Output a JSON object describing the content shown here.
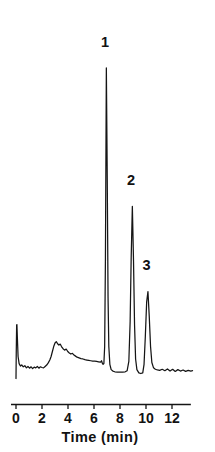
{
  "chart_data": {
    "type": "line",
    "title": "",
    "subtitle": "",
    "xlabel": "Time (min)",
    "ylabel": "",
    "xlim": [
      -0.25,
      13.6
    ],
    "ylim": [
      0,
      1.0
    ],
    "grid": false,
    "legend": "none",
    "x_ticks": [
      0,
      2,
      4,
      6,
      8,
      10,
      12
    ],
    "x_tick_labels": [
      "0",
      "2",
      "4",
      "6",
      "8",
      "10",
      "12"
    ],
    "y_ticks": [],
    "y_tick_labels": [],
    "annotations": [
      {
        "text": "1",
        "x": 6.85,
        "y": 0.935,
        "peak": 1
      },
      {
        "text": "2",
        "x": 8.85,
        "y": 0.545,
        "peak": 2
      },
      {
        "text": "3",
        "x": 10.05,
        "y": 0.305,
        "peak": 3
      }
    ],
    "peaks": [
      {
        "label": "1",
        "retention_time_min": 6.95,
        "apex_height": 0.875,
        "width_min": 0.38
      },
      {
        "label": "2",
        "retention_time_min": 8.95,
        "apex_height": 0.485,
        "width_min": 0.34
      },
      {
        "label": "3",
        "retention_time_min": 10.15,
        "apex_height": 0.245,
        "width_min": 0.32
      }
    ],
    "baseline_features": [
      {
        "name": "injection-spike",
        "x": 0.05,
        "height": 0.155
      },
      {
        "name": "broad-hump",
        "x": 3.05,
        "height": 0.105
      }
    ],
    "series": [
      {
        "name": "detector-signal",
        "color": "#151515",
        "x": [
          0.0,
          0.02,
          0.05,
          0.07,
          0.1,
          0.16,
          0.24,
          0.34,
          0.44,
          0.56,
          0.68,
          0.8,
          0.92,
          1.04,
          1.16,
          1.28,
          1.4,
          1.52,
          1.64,
          1.76,
          1.88,
          2.0,
          2.12,
          2.24,
          2.36,
          2.48,
          2.6,
          2.7,
          2.8,
          2.9,
          3.0,
          3.1,
          3.2,
          3.3,
          3.4,
          3.5,
          3.62,
          3.74,
          3.86,
          3.98,
          4.1,
          4.22,
          4.34,
          4.46,
          4.58,
          4.7,
          4.85,
          5.0,
          5.15,
          5.3,
          5.45,
          5.6,
          5.75,
          5.9,
          6.05,
          6.2,
          6.35,
          6.5,
          6.58,
          6.64,
          6.7,
          6.76,
          6.82,
          6.88,
          6.95,
          7.02,
          7.08,
          7.14,
          7.22,
          7.32,
          7.45,
          7.6,
          7.8,
          8.0,
          8.2,
          8.4,
          8.55,
          8.68,
          8.78,
          8.86,
          8.95,
          9.04,
          9.12,
          9.2,
          9.3,
          9.45,
          9.6,
          9.75,
          9.85,
          9.95,
          10.05,
          10.15,
          10.25,
          10.35,
          10.45,
          10.58,
          10.72,
          10.88,
          11.05,
          11.25,
          11.45,
          11.65,
          11.85,
          12.05,
          12.25,
          12.45,
          12.65,
          12.85,
          13.05,
          13.25,
          13.45,
          13.58
        ],
        "y": [
          0.0,
          0.075,
          0.15,
          0.152,
          0.12,
          0.062,
          0.042,
          0.035,
          0.038,
          0.033,
          0.036,
          0.03,
          0.034,
          0.029,
          0.033,
          0.028,
          0.032,
          0.03,
          0.034,
          0.029,
          0.033,
          0.031,
          0.03,
          0.034,
          0.038,
          0.044,
          0.052,
          0.062,
          0.076,
          0.09,
          0.1,
          0.104,
          0.098,
          0.094,
          0.097,
          0.09,
          0.084,
          0.08,
          0.083,
          0.076,
          0.072,
          0.069,
          0.071,
          0.066,
          0.063,
          0.06,
          0.058,
          0.056,
          0.055,
          0.053,
          0.052,
          0.051,
          0.05,
          0.049,
          0.049,
          0.048,
          0.047,
          0.046,
          0.05,
          0.043,
          0.04,
          0.042,
          0.09,
          0.34,
          0.875,
          0.56,
          0.23,
          0.09,
          0.04,
          0.025,
          0.021,
          0.019,
          0.018,
          0.018,
          0.018,
          0.019,
          0.022,
          0.048,
          0.16,
          0.34,
          0.485,
          0.33,
          0.15,
          0.055,
          0.025,
          0.016,
          0.014,
          0.016,
          0.04,
          0.12,
          0.215,
          0.245,
          0.175,
          0.09,
          0.045,
          0.03,
          0.026,
          0.024,
          0.023,
          0.026,
          0.022,
          0.027,
          0.021,
          0.026,
          0.02,
          0.025,
          0.021,
          0.024,
          0.02,
          0.023,
          0.021,
          0.022
        ]
      }
    ]
  },
  "figure": {
    "background_color": "#ffffff",
    "trace_color": "#151515",
    "axis_color": "#151515"
  }
}
